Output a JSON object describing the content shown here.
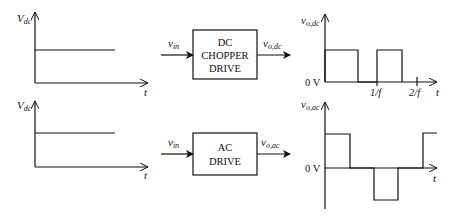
{
  "top_row": {
    "input_plot": {
      "y_label": "V",
      "y_label_sub": "dc",
      "x_label": "t"
    },
    "input_signal": {
      "label": "v",
      "label_sub": "in"
    },
    "block": {
      "line1": "DC",
      "line2": "CHOPPER",
      "line3": "DRIVE"
    },
    "output_signal": {
      "label": "v",
      "label_sub": "o,dc"
    },
    "output_plot": {
      "y_label": "v",
      "y_label_sub": "o,dc",
      "zero_label": "0 V",
      "x_ticks": [
        "1/f",
        "2/f"
      ],
      "x_label": "t"
    }
  },
  "bottom_row": {
    "input_plot": {
      "y_label": "V",
      "y_label_sub": "dc",
      "x_label": "t"
    },
    "input_signal": {
      "label": "v",
      "label_sub": "in"
    },
    "block": {
      "line1": "AC",
      "line2": "DRIVE"
    },
    "output_signal": {
      "label": "v",
      "label_sub": "o,ac"
    },
    "output_plot": {
      "y_label": "v",
      "y_label_sub": "o,ac",
      "zero_label": "0 V",
      "x_label": "t"
    }
  }
}
